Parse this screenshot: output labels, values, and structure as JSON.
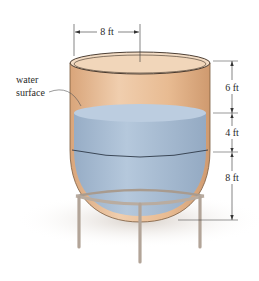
{
  "diagram": {
    "labels": {
      "top_radius": "8 ft",
      "water_surface": [
        "water",
        "surface"
      ],
      "dim_upper": "6 ft",
      "dim_middle": "4 ft",
      "dim_lower": "8 ft"
    },
    "colors": {
      "tank": "#e6b98f",
      "tank_inner": "#f3dcc4",
      "water": "#a9bfd6",
      "water_top": "#b8cadd",
      "stand": "#b9aca0",
      "shadow": "#e7e1dc",
      "line": "#2b2b2b"
    }
  }
}
